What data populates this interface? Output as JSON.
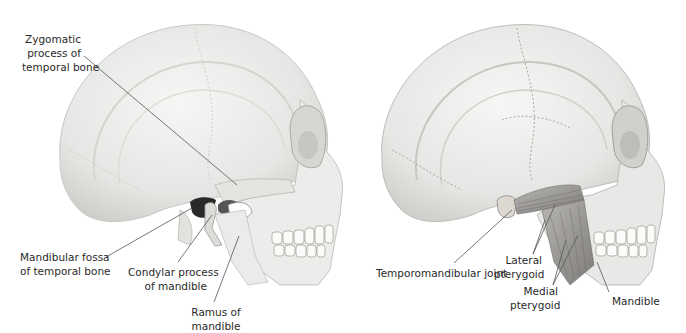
{
  "panels": [
    {
      "id": "left",
      "subject": "skull-lateral-view",
      "labels": [
        {
          "line1": "Zygomatic",
          "line2": "process of",
          "line3": "temporal bone"
        },
        {
          "line1": "Mandibular fossa",
          "line2": "of temporal bone"
        },
        {
          "line1": "Condylar process",
          "line2": "of mandible"
        },
        {
          "line1": "Ramus of",
          "line2": "mandible"
        }
      ]
    },
    {
      "id": "right",
      "subject": "skull-lateral-view-with-muscles",
      "labels": [
        {
          "line1": "Temporomandibular joint"
        },
        {
          "line1": "Lateral",
          "line2": "pterygoid"
        },
        {
          "line1": "Medial",
          "line2": "pterygoid"
        },
        {
          "line1": "Mandible"
        }
      ]
    }
  ],
  "colors": {
    "bone": "#ededec",
    "bone_shadow": "#c9c9c7",
    "suture": "#b5b5b2",
    "muscle": "#9a9896",
    "leader_line": "#555555",
    "text": "#2a2a2a"
  }
}
